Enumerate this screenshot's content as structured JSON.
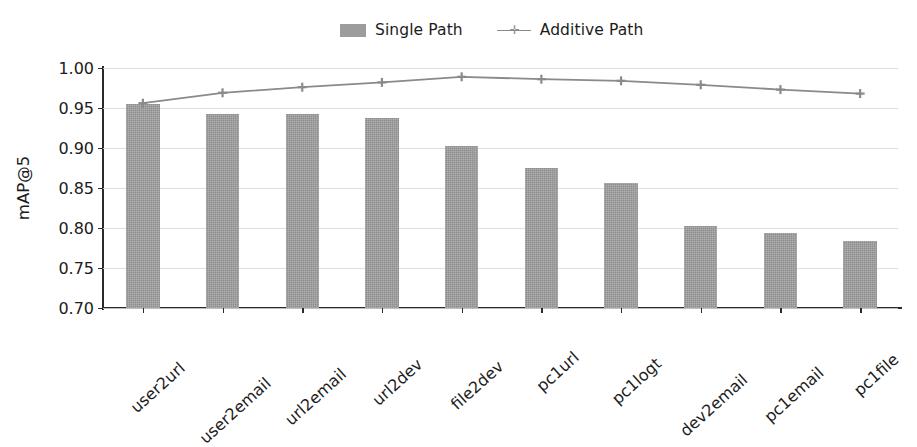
{
  "chart_data": {
    "type": "bar",
    "title": "",
    "xlabel": "",
    "ylabel": "mAP@5",
    "ylim": [
      0.7,
      1.0
    ],
    "yticks": [
      "0.70",
      "0.75",
      "0.80",
      "0.85",
      "0.90",
      "0.95",
      "1.00"
    ],
    "ytick_values": [
      0.7,
      0.75,
      0.8,
      0.85,
      0.9,
      0.95,
      1.0
    ],
    "grid": true,
    "legend_position": "upper center",
    "categories": [
      "user2url",
      "user2email",
      "url2email",
      "url2dev",
      "file2dev",
      "pc1url",
      "pc1logt",
      "dev2email",
      "pc1email",
      "pc1file"
    ],
    "series": [
      {
        "name": "Single Path",
        "kind": "bar",
        "color": "#9c9c9c",
        "values": [
          0.955,
          0.943,
          0.942,
          0.938,
          0.903,
          0.875,
          0.856,
          0.802,
          0.794,
          0.784
        ]
      },
      {
        "name": "Additive Path",
        "kind": "line",
        "color": "#8a8a8a",
        "marker": "plus",
        "values": [
          0.956,
          0.969,
          0.976,
          0.982,
          0.989,
          0.986,
          0.984,
          0.979,
          0.973,
          0.968
        ]
      }
    ]
  },
  "legend": {
    "entries": [
      {
        "label": "Single Path",
        "swatch": "bar-swatch",
        "color": "#9c9c9c"
      },
      {
        "label": "Additive Path",
        "swatch": "line-swatch",
        "color": "#8a8a8a",
        "marker_glyph": "✛"
      }
    ]
  },
  "axis": {
    "ylabel": "mAP@5",
    "ytick_labels": [
      "1.00",
      "0.95",
      "0.90",
      "0.85",
      "0.80",
      "0.75",
      "0.70"
    ],
    "xtick_labels": [
      "user2url",
      "user2email",
      "url2email",
      "url2dev",
      "file2dev",
      "pc1url",
      "pc1logt",
      "dev2email",
      "pc1email",
      "pc1file"
    ]
  },
  "colors": {
    "bar_fill": "#9c9c9c",
    "line": "#8a8a8a",
    "grid": "#d8d8d8",
    "spine": "#2a2a2a",
    "text": "#1c1c1c",
    "background": "#ffffff"
  }
}
